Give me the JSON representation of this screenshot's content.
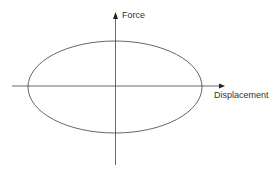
{
  "diagram": {
    "type": "hysteresis-loop",
    "axes": {
      "y_label": "Force",
      "x_label": "Displacement"
    },
    "shape": "ellipse",
    "colors": {
      "stroke": "#555555",
      "axis": "#444444",
      "text": "#333333",
      "background": "#ffffff"
    }
  }
}
